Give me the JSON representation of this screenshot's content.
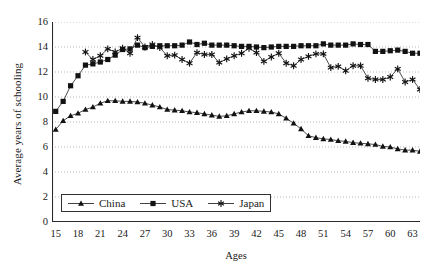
{
  "chart_data": {
    "type": "line",
    "title": "",
    "xlabel": "Ages",
    "ylabel": "Average years of schooling",
    "xlim": [
      14.5,
      64
    ],
    "ylim": [
      0,
      16
    ],
    "ytick_labels": [
      "0",
      "2",
      "4",
      "6",
      "8",
      "10",
      "12",
      "14",
      "16"
    ],
    "ytick_values": [
      0,
      2,
      4,
      6,
      8,
      10,
      12,
      14,
      16
    ],
    "xtick_labels": [
      "15",
      "18",
      "21",
      "24",
      "27",
      "30",
      "33",
      "36",
      "39",
      "42",
      "45",
      "48",
      "51",
      "54",
      "57",
      "60",
      "63"
    ],
    "xtick_values": [
      15,
      18,
      21,
      24,
      27,
      30,
      33,
      36,
      39,
      42,
      45,
      48,
      51,
      54,
      57,
      60,
      63
    ],
    "minor_tick_step": 1,
    "grid": "horizontal-dotted",
    "legend_position": "inside-bottom-left",
    "x": [
      15,
      16,
      17,
      18,
      19,
      20,
      21,
      22,
      23,
      24,
      25,
      26,
      27,
      28,
      29,
      30,
      31,
      32,
      33,
      34,
      35,
      36,
      37,
      38,
      39,
      40,
      41,
      42,
      43,
      44,
      45,
      46,
      47,
      48,
      49,
      50,
      51,
      52,
      53,
      54,
      55,
      56,
      57,
      58,
      59,
      60,
      61,
      62,
      63,
      64
    ],
    "series": [
      {
        "name": "China",
        "marker": "triangle",
        "color": "#1a1a1a",
        "values": [
          7.4,
          8.1,
          8.5,
          8.7,
          9.0,
          9.2,
          9.5,
          9.7,
          9.7,
          9.65,
          9.65,
          9.6,
          9.5,
          9.35,
          9.2,
          9.0,
          8.95,
          8.9,
          8.8,
          8.75,
          8.65,
          8.55,
          8.45,
          8.5,
          8.65,
          8.8,
          8.9,
          8.9,
          8.85,
          8.8,
          8.65,
          8.3,
          7.9,
          7.45,
          6.9,
          6.75,
          6.65,
          6.6,
          6.5,
          6.45,
          6.35,
          6.3,
          6.25,
          6.2,
          6.05,
          6.0,
          5.85,
          5.75,
          5.75,
          5.65
        ]
      },
      {
        "name": "USA",
        "marker": "square",
        "color": "#1a1a1a",
        "values": [
          8.85,
          9.65,
          10.9,
          11.7,
          12.55,
          12.65,
          12.8,
          13.0,
          13.35,
          13.8,
          13.85,
          14.15,
          13.95,
          14.05,
          14.1,
          14.1,
          14.1,
          14.15,
          14.4,
          14.2,
          14.3,
          14.15,
          14.15,
          14.15,
          14.1,
          14.05,
          14.05,
          14.0,
          13.95,
          14.0,
          14.05,
          14.05,
          14.05,
          14.1,
          14.1,
          14.1,
          14.25,
          14.15,
          14.15,
          14.15,
          14.25,
          14.2,
          14.2,
          13.65,
          13.65,
          13.7,
          13.75,
          13.65,
          13.5,
          13.5
        ]
      },
      {
        "name": "Japan",
        "marker": "asterisk",
        "color": "#1a1a1a",
        "values": [
          null,
          null,
          null,
          null,
          13.6,
          13.0,
          13.3,
          13.85,
          13.6,
          13.9,
          13.5,
          14.75,
          14.0,
          14.2,
          13.95,
          13.3,
          13.35,
          13.0,
          12.7,
          13.55,
          13.4,
          13.4,
          12.75,
          13.05,
          13.3,
          13.5,
          13.9,
          13.55,
          12.85,
          13.2,
          13.5,
          12.7,
          12.5,
          13.0,
          13.25,
          13.45,
          13.45,
          12.35,
          12.45,
          12.1,
          12.5,
          12.5,
          11.5,
          11.4,
          11.4,
          11.6,
          12.25,
          11.2,
          11.4,
          10.6
        ]
      }
    ],
    "legend": [
      {
        "label": "China",
        "marker": "triangle"
      },
      {
        "label": "USA",
        "marker": "square"
      },
      {
        "label": "Japan",
        "marker": "asterisk"
      }
    ]
  }
}
